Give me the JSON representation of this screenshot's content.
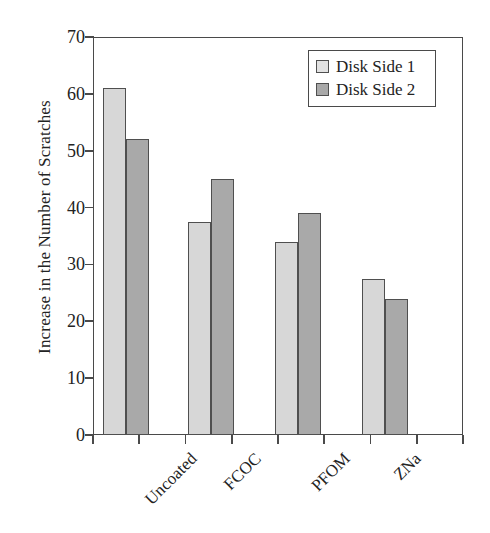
{
  "chart_data": {
    "type": "bar",
    "title": "",
    "xlabel": "",
    "ylabel": "Increase in the Number of Scratches",
    "categories": [
      "Uncoated",
      "FCOC",
      "PFOM",
      "ZNa"
    ],
    "series": [
      {
        "name": "Disk Side 1",
        "values": [
          61,
          37.5,
          34,
          27.5
        ],
        "color": "#d7d7d7"
      },
      {
        "name": "Disk Side 2",
        "values": [
          52,
          45,
          39,
          24
        ],
        "color": "#a9a9a9"
      }
    ],
    "ylim": [
      0,
      70
    ],
    "yticks": [
      0,
      10,
      20,
      30,
      40,
      50,
      60,
      70
    ],
    "ytick_labels": [
      "0",
      "10",
      "20",
      "30",
      "40",
      "50",
      "60",
      "70"
    ],
    "grid": false,
    "legend_position": "top-right",
    "legend_entries": [
      "Disk Side 1",
      "Disk Side 2"
    ],
    "frame": true,
    "xtick_count": 9
  }
}
